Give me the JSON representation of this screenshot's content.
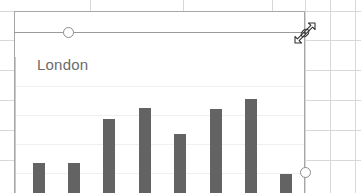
{
  "app": {
    "kind": "spreadsheet-chart-object",
    "canvas_width": 361,
    "canvas_height": 193
  },
  "sheet": {
    "background_color": "#ffffff",
    "gridline_color": "#d8d8d8",
    "column_lines_x": [
      90,
      183,
      272,
      305,
      330,
      355
    ],
    "row_lines_y": [
      11,
      40,
      70,
      100,
      130,
      160
    ]
  },
  "chart_object": {
    "state": "selected",
    "border_color": "#a6a6a6",
    "selection_line_color": "#9a9a9a",
    "handle_fill": "#ffffff",
    "handle_stroke": "#8c8c8c",
    "handles": [
      {
        "name": "top-middle-handle",
        "x": 68,
        "y": 33
      },
      {
        "name": "bottom-right-handle",
        "x": 305,
        "y": 173
      }
    ]
  },
  "cursor": {
    "name": "resize-diagonal-cursor",
    "direction": "ne-sw",
    "x": 305,
    "y": 33
  },
  "chart_data": {
    "type": "bar",
    "title": "London",
    "title_color": "#6b6b6b",
    "xlabel": "",
    "ylabel": "",
    "categories": [
      "1",
      "2",
      "3",
      "4",
      "5",
      "6",
      "7",
      "8"
    ],
    "values": [
      28,
      28,
      58,
      66,
      48,
      65,
      72,
      20
    ],
    "ylim": [
      0,
      100
    ],
    "grid": true,
    "gridline_color": "#f0f0f0",
    "legend": "none",
    "bar_color": "#636363",
    "axis_color": "#b5b5b5"
  }
}
